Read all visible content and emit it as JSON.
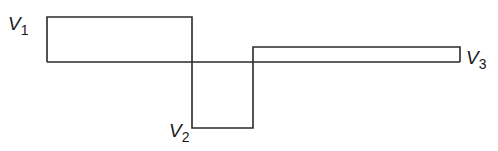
{
  "diagram": {
    "type": "voltage-waveform",
    "stroke_color": "#2a2a2a",
    "baseline": {
      "y": 62,
      "x_start": 47,
      "x_end": 460
    },
    "pulses": [
      {
        "name": "V1",
        "x_start": 47,
        "x_end": 192,
        "level_y": 17,
        "polarity": "positive"
      },
      {
        "name": "V2",
        "x_start": 192,
        "x_end": 253,
        "level_y": 128,
        "polarity": "negative"
      },
      {
        "name": "V3",
        "x_start": 253,
        "x_end": 460,
        "level_y": 47,
        "polarity": "positive"
      }
    ],
    "labels": [
      {
        "main": "V",
        "sub": "1"
      },
      {
        "main": "V",
        "sub": "2"
      },
      {
        "main": "V",
        "sub": "3"
      }
    ]
  }
}
